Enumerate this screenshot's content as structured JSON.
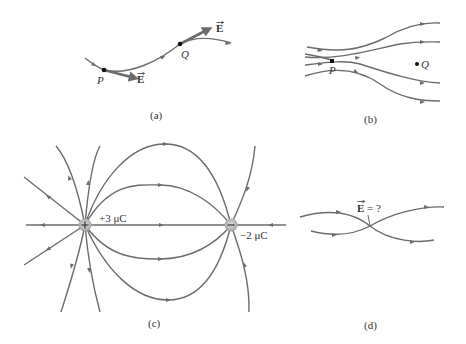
{
  "figure": {
    "panels": [
      {
        "id": "a",
        "caption": "(a)",
        "points": [
          {
            "label": "P"
          },
          {
            "label": "Q"
          }
        ],
        "vectors": [
          {
            "label": "E",
            "at": "P"
          },
          {
            "label": "E",
            "at": "Q"
          }
        ]
      },
      {
        "id": "b",
        "caption": "(b)",
        "points": [
          {
            "label": "P"
          },
          {
            "label": "Q"
          }
        ]
      },
      {
        "id": "c",
        "caption": "(c)",
        "charges": [
          {
            "sign": "+",
            "label": "+3 μC"
          },
          {
            "sign": "−",
            "label": "−2 μC"
          }
        ]
      },
      {
        "id": "d",
        "caption": "(d)",
        "question_label": "E = ?",
        "question_vector": "E",
        "question_rest": " = ?"
      }
    ]
  },
  "colors": {
    "line": "#6b6b6b",
    "charge_fill": "#b9b9b9",
    "text": "#333333"
  }
}
